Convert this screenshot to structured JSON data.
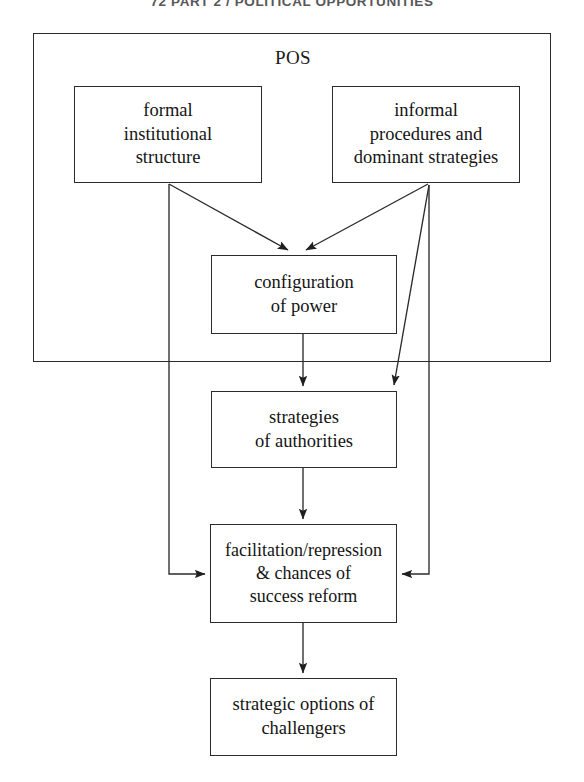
{
  "page": {
    "running_head": "72  PART 2 / POLITICAL OPPORTUNITIES",
    "background_color": "#ffffff",
    "line_color": "#2b2b2b",
    "text_color": "#141414"
  },
  "diagram": {
    "type": "flowchart",
    "container": {
      "label": "POS",
      "name": "pos-frame"
    },
    "nodes": [
      {
        "id": "formal",
        "label": "formal\ninstitutional\nstructure"
      },
      {
        "id": "informal",
        "label": "informal\nprocedures and\ndominant strategies"
      },
      {
        "id": "configuration",
        "label": "configuration\nof power"
      },
      {
        "id": "strategies",
        "label": "strategies\nof authorities"
      },
      {
        "id": "facilitation",
        "label": "facilitation/repression\n& chances of\nsuccess reform"
      },
      {
        "id": "challengers",
        "label": "strategic options of\nchallengers"
      }
    ],
    "edges": [
      {
        "from": "formal",
        "to": "configuration",
        "style": "diagonal-arrow"
      },
      {
        "from": "informal",
        "to": "configuration",
        "style": "diagonal-arrow"
      },
      {
        "from": "informal",
        "to": "strategies",
        "style": "diagonal-arrow"
      },
      {
        "from": "configuration",
        "to": "strategies",
        "style": "vertical-arrow"
      },
      {
        "from": "strategies",
        "to": "facilitation",
        "style": "vertical-arrow"
      },
      {
        "from": "formal",
        "to": "facilitation",
        "style": "elbow-arrow-left"
      },
      {
        "from": "informal",
        "to": "facilitation",
        "style": "elbow-arrow-right"
      },
      {
        "from": "facilitation",
        "to": "challengers",
        "style": "vertical-arrow"
      }
    ]
  }
}
